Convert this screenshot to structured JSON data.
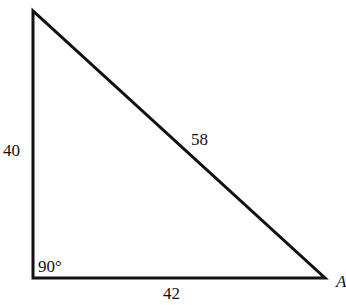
{
  "diagram": {
    "type": "right-triangle",
    "sides": {
      "vertical_leg": "40",
      "horizontal_leg": "42",
      "hypotenuse": "58"
    },
    "right_angle_label": "90°",
    "vertex_label": "A",
    "stroke_color": "#111111"
  }
}
